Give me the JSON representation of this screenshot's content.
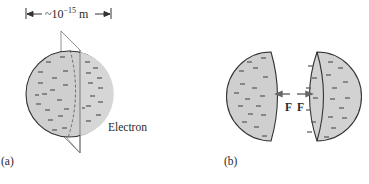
{
  "panel_a": {
    "label": "(a)",
    "dimension_approx": "~10",
    "dimension_exponent": "−15",
    "dimension_unit": "m",
    "object_label": "Electron"
  },
  "panel_b": {
    "label": "(b)",
    "force_left": "F",
    "force_right": "F"
  },
  "colors": {
    "fill": "#cfcfcf",
    "stroke": "#333333",
    "charge": "#555555"
  }
}
